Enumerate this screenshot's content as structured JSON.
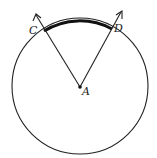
{
  "diagram": {
    "type": "circle-central-angle",
    "center": {
      "label": "A",
      "x": 80,
      "y": 87
    },
    "radius": 68,
    "points": [
      {
        "label": "C",
        "x": 44,
        "y": 31
      },
      {
        "label": "D",
        "x": 112,
        "y": 29
      }
    ],
    "rays": [
      {
        "from": "A",
        "through": "C",
        "tip": [
          36,
          14
        ]
      },
      {
        "from": "A",
        "through": "D",
        "tip": [
          122,
          11
        ]
      }
    ],
    "highlighted_arc": {
      "from": "C",
      "to": "D",
      "style": "bold"
    },
    "colors": {
      "stroke": "#222222",
      "background": "#ffffff"
    }
  }
}
